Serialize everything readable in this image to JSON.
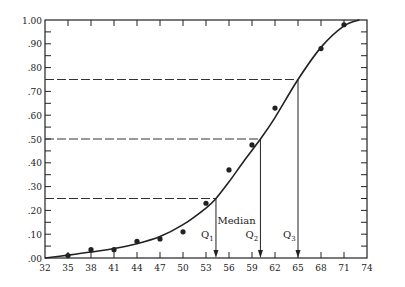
{
  "chart_data": {
    "type": "scatter",
    "title": "",
    "xlabel": "",
    "ylabel": "",
    "xlim": [
      32,
      74
    ],
    "ylim": [
      0.0,
      1.0
    ],
    "x_ticks": [
      32,
      35,
      38,
      41,
      44,
      47,
      50,
      53,
      56,
      59,
      62,
      65,
      68,
      71,
      74
    ],
    "x_tick_labels": [
      "32",
      "35",
      "38",
      "41",
      "44",
      "47",
      "50",
      "53",
      "56",
      "59",
      "62",
      "65",
      "68",
      "71",
      "74"
    ],
    "y_ticks": [
      0.0,
      0.1,
      0.2,
      0.3,
      0.4,
      0.5,
      0.6,
      0.7,
      0.8,
      0.9,
      1.0
    ],
    "y_tick_labels": [
      ".00",
      ".10",
      ".20",
      ".30",
      ".40",
      ".50",
      ".60",
      ".70",
      ".80",
      ".90",
      "1.00"
    ],
    "grid": false,
    "series": [
      {
        "name": "observed cumulative proportion",
        "kind": "points",
        "x": [
          35,
          38,
          41,
          44,
          47,
          50,
          53,
          56,
          59,
          62,
          68,
          71
        ],
        "y": [
          0.01,
          0.035,
          0.035,
          0.07,
          0.08,
          0.11,
          0.23,
          0.37,
          0.475,
          0.63,
          0.88,
          0.98
        ]
      },
      {
        "name": "fitted ogive curve",
        "kind": "line",
        "x": [
          32,
          35,
          38,
          41,
          44,
          47,
          50,
          53,
          54.3,
          56,
          58,
          60.1,
          62,
          65,
          68,
          71,
          73
        ],
        "y": [
          0.0,
          0.012,
          0.025,
          0.04,
          0.06,
          0.09,
          0.14,
          0.21,
          0.25,
          0.32,
          0.41,
          0.5,
          0.59,
          0.75,
          0.885,
          0.975,
          1.0
        ]
      }
    ],
    "reference_lines": [
      {
        "level": 0.25,
        "x": 54.3,
        "label": "Q",
        "subscript": "1"
      },
      {
        "level": 0.5,
        "x": 60.1,
        "label": "Q",
        "subscript": "2",
        "extra_label": "Median"
      },
      {
        "level": 0.75,
        "x": 65.0,
        "label": "Q",
        "subscript": "3"
      }
    ]
  },
  "colors": {
    "ink": "#222222",
    "dash": "#333333",
    "background": "#ffffff"
  }
}
